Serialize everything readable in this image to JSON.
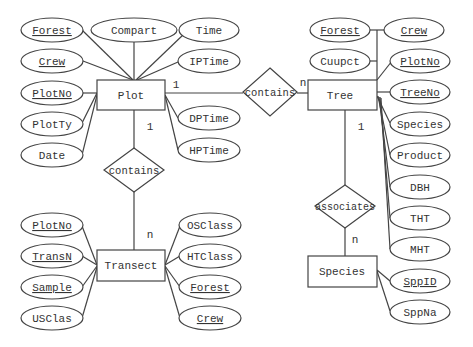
{
  "entities": {
    "plot": "Plot",
    "tree": "Tree",
    "transect": "Transect",
    "species": "Species"
  },
  "relationships": {
    "plot_tree": "contains",
    "plot_transect": "contains",
    "tree_species": "associates"
  },
  "cardinality": {
    "plot_tree_plot": "1",
    "plot_tree_tree": "n",
    "plot_transect_plot": "1",
    "plot_transect_transect": "n",
    "tree_species_tree": "1",
    "tree_species_species": "n"
  },
  "plot_attrs": {
    "forest": "Forest",
    "compart": "Compart",
    "time": "Time",
    "crew": "Crew",
    "iptime": "IPTime",
    "plotno": "PlotNo",
    "plotty": "PlotTy",
    "date": "Date",
    "dptime": "DPTime",
    "hptime": "HPTime"
  },
  "tree_attrs": {
    "forest": "Forest",
    "crew": "Crew",
    "cuupct": "Cuupct",
    "plotno": "PlotNo",
    "treeno": "TreeNo",
    "species": "Species",
    "product": "Product",
    "dbh": "DBH",
    "tht": "THT",
    "mht": "MHT"
  },
  "transect_attrs": {
    "plotno": "PlotNo",
    "transn": "TransN",
    "sample": "Sample",
    "usclas": "USClas",
    "osclass": "OSClass",
    "htclass": "HTClass",
    "forest": "Forest",
    "crew": "Crew"
  },
  "species_attrs": {
    "sppid": "SppID",
    "sppna": "SppNa"
  }
}
